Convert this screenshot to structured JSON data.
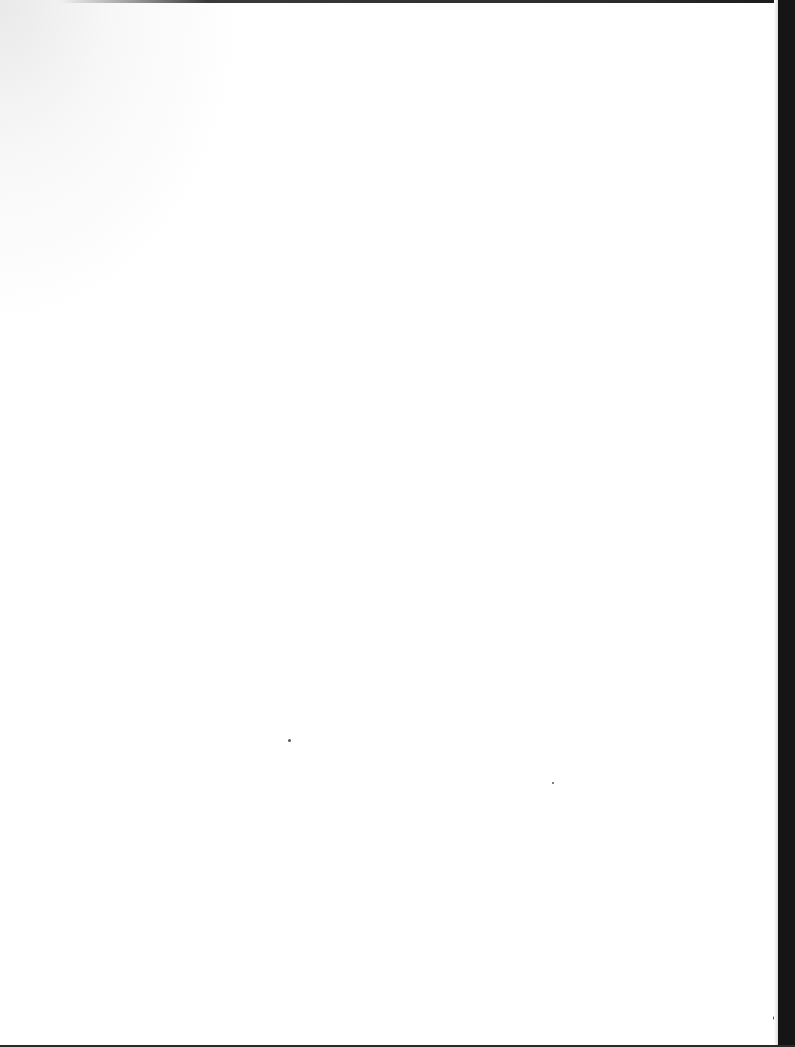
{
  "document": {
    "type": "scanned-page",
    "content": "",
    "background_color": "#ffffff",
    "border_color": "#151515"
  }
}
